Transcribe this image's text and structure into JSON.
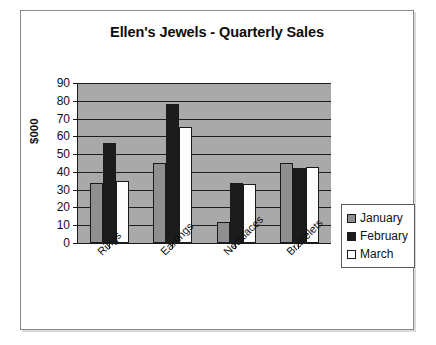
{
  "chart_data": {
    "type": "bar",
    "title": "Ellen's Jewels - Quarterly Sales",
    "xlabel": "",
    "ylabel": "$000",
    "ylim": [
      0,
      90
    ],
    "ytick_step": 10,
    "yticks": [
      90,
      80,
      70,
      60,
      50,
      40,
      30,
      20,
      10,
      0
    ],
    "grid": true,
    "grid_axis": "y",
    "legend_position": "right",
    "plot_background": "#a9a9a9",
    "categories": [
      "Rings",
      "Earrings",
      "Necklaces",
      "Bracelets"
    ],
    "series": [
      {
        "name": "January",
        "color": "#8f8f8f",
        "values": [
          34,
          45,
          12,
          45
        ]
      },
      {
        "name": "February",
        "color": "#1c1c1c",
        "values": [
          56,
          78,
          34,
          42
        ]
      },
      {
        "name": "March",
        "color": "#ffffff",
        "values": [
          35,
          65,
          33,
          43
        ]
      }
    ]
  },
  "legend": {
    "items": [
      {
        "label": "January",
        "swatch": "jan"
      },
      {
        "label": "February",
        "swatch": "feb"
      },
      {
        "label": "March",
        "swatch": "mar"
      }
    ]
  }
}
